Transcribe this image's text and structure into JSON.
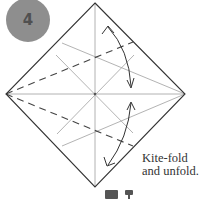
{
  "step": {
    "number": "4"
  },
  "caption": {
    "line1": "Kite-fold",
    "line2": "and unfold."
  },
  "colors": {
    "badge": "#8e8e8e",
    "badge_text": "#505050",
    "edge": "#333333",
    "crease": "#9a9a9a",
    "dash": "#444444"
  },
  "icons": [
    "valley-fold-legend-icon",
    "flip-symbol-icon"
  ]
}
